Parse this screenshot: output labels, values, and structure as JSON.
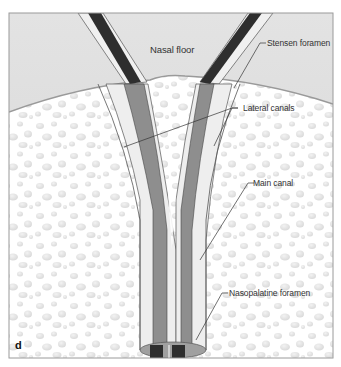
{
  "figure": {
    "panel_letter": "d",
    "regions": {
      "nasal_floor": "Nasal floor"
    },
    "labels": {
      "stensen_foramen": "Stensen foramen",
      "lateral_canals": "Lateral canals",
      "main_canal": "Main canal",
      "nasopalatine_foramen": "Nasopalatine foramen"
    },
    "colors": {
      "nasal_area": "#d9d9d9",
      "bone": "#ffffff",
      "bone_pores": "#e6e6e6",
      "canal_dark": "#333333",
      "canal_mid": "#8c8c8c",
      "canal_light": "#e8e8e8",
      "frame": "#999999"
    }
  }
}
